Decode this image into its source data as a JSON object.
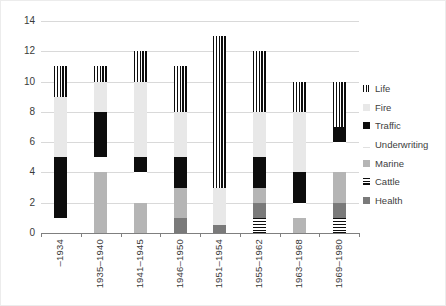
{
  "chart_data": {
    "type": "bar",
    "stacked": true,
    "title": "",
    "xlabel": "",
    "ylabel": "",
    "ylim": [
      0,
      14
    ],
    "yticks": [
      0,
      2,
      4,
      6,
      8,
      10,
      12,
      14
    ],
    "grid": true,
    "legend_position": "right",
    "categories": [
      "–1934",
      "1935–1940",
      "1941–1945",
      "1946–1950",
      "1951–1954",
      "1955–1962",
      "1963–1968",
      "1969–1980"
    ],
    "series": [
      {
        "name": "Cattle",
        "fill": "hstripes",
        "color": "",
        "values": [
          0,
          0,
          0,
          0,
          0,
          1,
          0,
          1
        ]
      },
      {
        "name": "Health",
        "fill": "solid",
        "color": "#7a7a7a",
        "values": [
          0,
          0,
          0,
          1,
          0.5,
          1,
          0,
          1
        ]
      },
      {
        "name": "Marine",
        "fill": "solid",
        "color": "#b5b5b5",
        "values": [
          0,
          4,
          2,
          2,
          0,
          1,
          1,
          2
        ]
      },
      {
        "name": "Underwriting",
        "fill": "solid",
        "color": "#ffffff",
        "values": [
          1,
          1,
          2,
          0,
          0,
          0,
          1,
          2
        ]
      },
      {
        "name": "Traffic",
        "fill": "solid",
        "color": "#0d0d0d",
        "values": [
          4,
          3,
          1,
          2,
          0,
          2,
          2,
          1
        ]
      },
      {
        "name": "Fire",
        "fill": "solid",
        "color": "#e8e8e8",
        "values": [
          4,
          2,
          5,
          3,
          2.5,
          3,
          4,
          0
        ]
      },
      {
        "name": "Life",
        "fill": "vstripes",
        "color": "",
        "values": [
          2,
          1,
          2,
          3,
          10,
          4,
          2,
          3
        ]
      }
    ],
    "bar_totals": [
      11,
      11,
      12,
      11,
      13,
      12,
      10,
      10
    ],
    "legend_order": [
      "Life",
      "Fire",
      "Traffic",
      "Underwriting",
      "Marine",
      "Cattle",
      "Health"
    ]
  },
  "colors": {
    "gridline": "#d9d9d9",
    "axis": "#7f7f7f",
    "text": "#3a3a3a",
    "legend_text": "#404040",
    "background": "#ffffff"
  }
}
